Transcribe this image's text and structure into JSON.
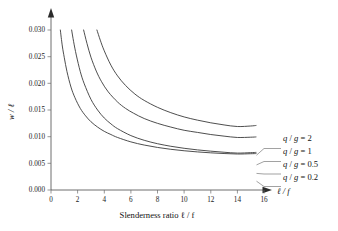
{
  "chart_data": {
    "type": "line",
    "title": "",
    "subtitle": "",
    "xlabel": "Slenderness ratio ℓ / f",
    "xlabel_axis_short": "ℓ / f",
    "ylabel": "w / ℓ",
    "xlim": [
      0,
      16.8
    ],
    "ylim": [
      0,
      0.0315
    ],
    "xticks": [
      0,
      2,
      4,
      6,
      8,
      10,
      12,
      14,
      16
    ],
    "xticklabels": [
      "0",
      "2",
      "4",
      "6",
      "8",
      "10",
      "12",
      "14",
      "16"
    ],
    "yticks": [
      0.0,
      0.005,
      0.01,
      0.015,
      0.02,
      0.025,
      0.03
    ],
    "yticklabels": [
      "0.000",
      "0.005",
      "0.010",
      "0.015",
      "0.020",
      "0.025",
      "0.030"
    ],
    "grid": false,
    "legend_position": "right-inline-callout",
    "axis_arrows": [
      "x-right",
      "y-top"
    ],
    "series": [
      {
        "name": "q / g = 2",
        "label_q": "q",
        "label_sep": " / ",
        "label_g": "g",
        "label_eq": " = 2",
        "value": 2,
        "x": [
          0.7,
          0.85,
          1.0,
          1.2,
          1.5,
          1.8,
          2.2,
          2.6,
          3.0,
          3.5,
          4.0,
          4.5,
          5.0,
          6.0,
          7.0,
          8.0,
          9.0,
          10.0,
          11.0,
          12.0,
          13.0,
          14.0,
          15.0,
          15.4
        ],
        "y": [
          0.03,
          0.027,
          0.0248,
          0.0222,
          0.0193,
          0.0173,
          0.0153,
          0.0139,
          0.0128,
          0.0118,
          0.011,
          0.0104,
          0.00985,
          0.00902,
          0.00843,
          0.00798,
          0.00763,
          0.00736,
          0.00714,
          0.00697,
          0.00684,
          0.00675,
          0.0068,
          0.00683
        ]
      },
      {
        "name": "q / g = 1",
        "label_q": "q",
        "label_sep": " / ",
        "label_g": "g",
        "label_eq": " = 1",
        "value": 1,
        "x": [
          1.55,
          1.7,
          1.9,
          2.2,
          2.5,
          3.0,
          3.5,
          4.0,
          4.5,
          5.0,
          6.0,
          7.0,
          8.0,
          9.0,
          10.0,
          11.0,
          12.0,
          13.0,
          14.0,
          15.0,
          15.4
        ],
        "y": [
          0.03,
          0.0278,
          0.0253,
          0.0222,
          0.0199,
          0.017,
          0.015,
          0.0135,
          0.0124,
          0.0115,
          0.0102,
          0.00932,
          0.00868,
          0.0082,
          0.00782,
          0.00752,
          0.00728,
          0.00708,
          0.00692,
          0.007,
          0.00705
        ]
      },
      {
        "name": "q / g = 0.5",
        "label_q": "q",
        "label_sep": " / ",
        "label_g": "g",
        "label_eq": " = 0.5",
        "value": 0.5,
        "x": [
          2.45,
          2.7,
          3.0,
          3.4,
          3.8,
          4.3,
          5.0,
          5.6,
          6.2,
          7.0,
          8.0,
          9.0,
          10.0,
          11.0,
          12.0,
          13.0,
          14.0,
          15.0,
          15.4
        ],
        "y": [
          0.03,
          0.0275,
          0.0249,
          0.0223,
          0.0203,
          0.0184,
          0.0165,
          0.0153,
          0.0144,
          0.0134,
          0.0125,
          0.0118,
          0.0112,
          0.0108,
          0.0104,
          0.0101,
          0.00985,
          0.0099,
          0.00995
        ]
      },
      {
        "name": "q / g = 0.2",
        "label_q": "q",
        "label_sep": " / ",
        "label_g": "g",
        "label_eq": " = 0.2",
        "value": 0.2,
        "x": [
          3.45,
          3.7,
          4.0,
          4.5,
          5.0,
          5.6,
          6.3,
          7.0,
          8.0,
          9.0,
          10.0,
          11.0,
          12.0,
          13.0,
          14.0,
          15.0,
          15.4
        ],
        "y": [
          0.03,
          0.0281,
          0.0261,
          0.0234,
          0.0214,
          0.0196,
          0.018,
          0.0168,
          0.0155,
          0.0145,
          0.0137,
          0.0131,
          0.0126,
          0.0122,
          0.0119,
          0.012,
          0.0121
        ]
      }
    ]
  },
  "figure": {
    "background_color": "#ffffff",
    "curve_color": "#3a3a3a",
    "axis_color": "#4a4a4a",
    "text_color": "#111111"
  }
}
